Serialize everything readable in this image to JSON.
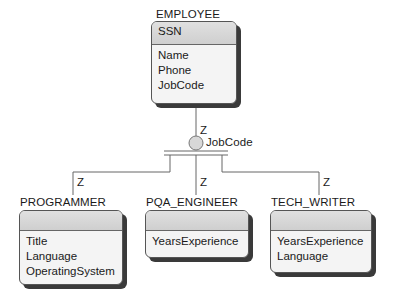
{
  "diagram": {
    "type": "er-generalization",
    "supertype": {
      "name": "EMPLOYEE",
      "identifier": "SSN",
      "attributes": [
        "Name",
        "Phone",
        "JobCode"
      ]
    },
    "discriminator": {
      "label": "JobCode",
      "cardinality_marker": "Z"
    },
    "subtypes": [
      {
        "name": "PROGRAMMER",
        "marker": "Z",
        "identifier": "",
        "attributes": [
          "Title",
          "Language",
          "OperatingSystem"
        ]
      },
      {
        "name": "PQA_ENGINEER",
        "marker": "Z",
        "identifier": "",
        "attributes": [
          "YearsExperience"
        ]
      },
      {
        "name": "TECH_WRITER",
        "marker": "Z",
        "identifier": "",
        "attributes": [
          "YearsExperience",
          "Language"
        ]
      }
    ]
  },
  "colors": {
    "header_fill": "#d6d6d6",
    "body_fill": "#f4f4f4",
    "shadow": "#3a3a3a",
    "line": "#666666"
  }
}
